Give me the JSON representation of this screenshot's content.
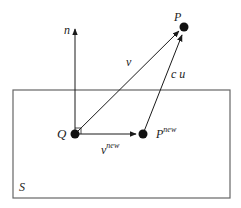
{
  "diagram": {
    "type": "vector-projection",
    "region": {
      "label": "S"
    },
    "points": {
      "P": {
        "label": "P"
      },
      "Q": {
        "label": "Q"
      },
      "P_new": {
        "label": "P",
        "superscript": "new"
      }
    },
    "vectors": {
      "normal": {
        "label": "n"
      },
      "v": {
        "label": "v"
      },
      "cu": {
        "label": "c u"
      },
      "v_new": {
        "label": "v",
        "superscript": "new"
      }
    },
    "colors": {
      "stroke": "#1a1a1a",
      "frame": "#666666"
    }
  }
}
